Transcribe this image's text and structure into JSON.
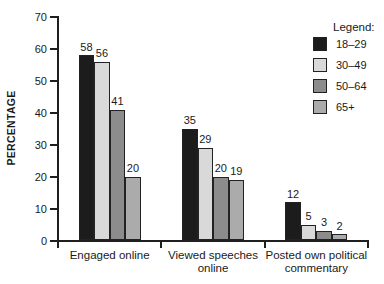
{
  "chart_data": {
    "type": "bar",
    "title": "",
    "xlabel": "",
    "ylabel": "PERCENTAGE",
    "ylim": [
      0,
      70
    ],
    "yticks": [
      0,
      10,
      20,
      30,
      40,
      50,
      60,
      70
    ],
    "grid": false,
    "bar_value_labels": true,
    "categories": [
      "Engaged online",
      "Viewed speeches online",
      "Posted own political commentary"
    ],
    "series": [
      {
        "name": "18–29",
        "color": "#1c1c1c",
        "values": [
          58,
          35,
          12
        ]
      },
      {
        "name": "30–49",
        "color": "#d9d9d9",
        "values": [
          56,
          29,
          5
        ]
      },
      {
        "name": "50–64",
        "color": "#8c8c8c",
        "values": [
          41,
          20,
          3
        ]
      },
      {
        "name": "65+",
        "color": "#ababab",
        "values": [
          20,
          19,
          2
        ]
      }
    ],
    "legend": {
      "title": "Legend:",
      "position": "top-right"
    },
    "axis_color": "#1f1f1f"
  }
}
